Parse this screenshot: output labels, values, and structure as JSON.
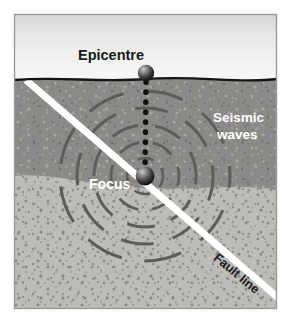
{
  "figure": {
    "type": "diagram",
    "width": 291,
    "height": 323
  },
  "labels": {
    "epicentre": "Epicentre",
    "seismic_waves_line1": "Seismic",
    "seismic_waves_line2": "waves",
    "focus": "Focus",
    "fault_line": "Fault line"
  },
  "colors": {
    "sky_top": "#d8d8d6",
    "sky_bottom": "#f2f2f0",
    "upper_rock": "#8a8a88",
    "lower_rock": "#bcbcb8",
    "ground_line": "#151515",
    "fault_line": "#ffffff",
    "wave_ring": "#5c5c5a",
    "dotted_line": "#111111",
    "label_dark": "#1a1a1a",
    "label_light": "#ffffff",
    "frame_border": "#9a9a98",
    "page_background": "#ffffff"
  },
  "geometry": {
    "epicentre_point": {
      "x": 146,
      "y": 74
    },
    "focus_point": {
      "x": 145,
      "y": 176
    },
    "ground_surface_y": 80,
    "layer_boundary_y": 184,
    "wave_ring_radii": [
      18,
      34,
      51,
      68,
      85
    ],
    "fault_start": {
      "x": 28,
      "y": 82
    },
    "fault_end": {
      "x": 281,
      "y": 300
    },
    "fault_angle_deg": 40,
    "dotted_line_dot_count": 10
  },
  "elements": {
    "sky_region": "sky",
    "upper_rock_region": "crust-upper-layer",
    "lower_rock_region": "crust-lower-layer",
    "epicentre_marker": "epicentre-sphere",
    "focus_marker": "focus-sphere",
    "wave_rings": "seismic-wave-rings",
    "depth_line": "focus-to-epicentre-dotted-line",
    "fault": "fault-line-stroke"
  }
}
